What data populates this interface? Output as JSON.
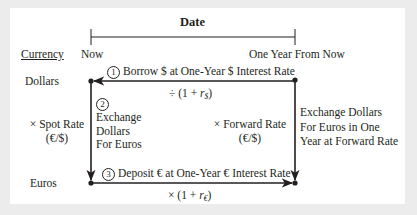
{
  "diagram": {
    "title": "Date",
    "column_header": "Currency",
    "timeline": {
      "start_label": "Now",
      "end_label": "One Year From Now"
    },
    "rows": {
      "top": "Dollars",
      "bottom": "Euros"
    },
    "left_conversion": {
      "line1": "× Spot Rate",
      "line2": "(€/$)"
    },
    "steps": [
      {
        "number": "1",
        "label": "Borrow $ at One-Year $ Interest Rate",
        "formula_prefix": "÷ (1 + ",
        "formula_var": "r",
        "formula_sub": "$",
        "formula_suffix": ")"
      },
      {
        "number": "2",
        "lines": [
          "Exchange",
          "Dollars",
          "For Euros"
        ]
      },
      {
        "number": "3",
        "label": "Deposit € at One-Year € Interest Rate",
        "formula_prefix": "× (1 + ",
        "formula_var": "r",
        "formula_sub": "€",
        "formula_suffix": ")"
      }
    ],
    "forward": {
      "line1": "× Forward Rate",
      "line2": "(€/$)"
    },
    "right_note": [
      "Exchange Dollars",
      "For Euros in One",
      "Year at Forward Rate"
    ],
    "colors": {
      "background": "#ececec",
      "panel": "#ffffff",
      "ink": "#231f20"
    }
  }
}
